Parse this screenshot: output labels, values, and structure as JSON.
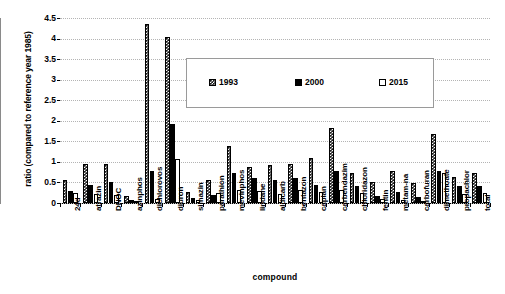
{
  "chart_data": {
    "type": "bar",
    "title": "",
    "xlabel": "compound",
    "ylabel": "ratio (compared to reference year 1985)",
    "ylim": [
      0,
      4.5
    ],
    "ytick_labels": [
      "0",
      "0.5",
      "1",
      "1.5",
      "2",
      "2.5",
      "3",
      "3.5",
      "4",
      "4.5"
    ],
    "ytick_values": [
      0,
      0.5,
      1,
      1.5,
      2,
      2.5,
      3,
      3.5,
      4,
      4.5
    ],
    "grid": true,
    "legend_position": "upper-center",
    "categories": [
      "24d",
      "atrazin",
      "DNOC",
      "azinphos",
      "dichlorovos",
      "diuron",
      "simazin",
      "parathion",
      "mevinphos",
      "lindane",
      "aldicarb",
      "bentazon",
      "caplan",
      "carbendazim",
      "chloridazon",
      "fentin",
      "metam-na",
      "carbofuran",
      "dimethoate",
      "propachlor",
      "total"
    ],
    "series": [
      {
        "name": "1993",
        "color": "#1a1a1a",
        "pattern": "checkered",
        "values": [
          0.55,
          0.95,
          0.95,
          0.18,
          4.35,
          4.05,
          0.28,
          0.55,
          1.38,
          0.88,
          0.92,
          0.95,
          1.1,
          1.83,
          0.72,
          0.5,
          0.78,
          0.48,
          1.67,
          0.63,
          0.72
        ]
      },
      {
        "name": "2000",
        "color": "#000000",
        "pattern": "solid",
        "values": [
          0.3,
          0.45,
          0.5,
          0.07,
          0.78,
          1.92,
          0.13,
          0.2,
          0.72,
          0.6,
          0.55,
          0.62,
          0.45,
          0.78,
          0.42,
          0.18,
          0.28,
          0.15,
          0.78,
          0.42,
          0.42
        ]
      },
      {
        "name": "2015",
        "color": "#ffffff",
        "pattern": "empty",
        "values": [
          0.25,
          0.22,
          0.2,
          0.03,
          0.1,
          1.08,
          0.07,
          0.25,
          0.32,
          0.3,
          0.22,
          0.32,
          0.28,
          0.32,
          0.25,
          0.1,
          0.07,
          0.05,
          0.72,
          0.22,
          0.25
        ]
      }
    ]
  },
  "legend": {
    "items": [
      {
        "label": "1993"
      },
      {
        "label": "2000"
      },
      {
        "label": "2015"
      }
    ]
  },
  "axes": {
    "y_title": "ratio (compared to reference year 1985)",
    "x_title": "compound"
  }
}
